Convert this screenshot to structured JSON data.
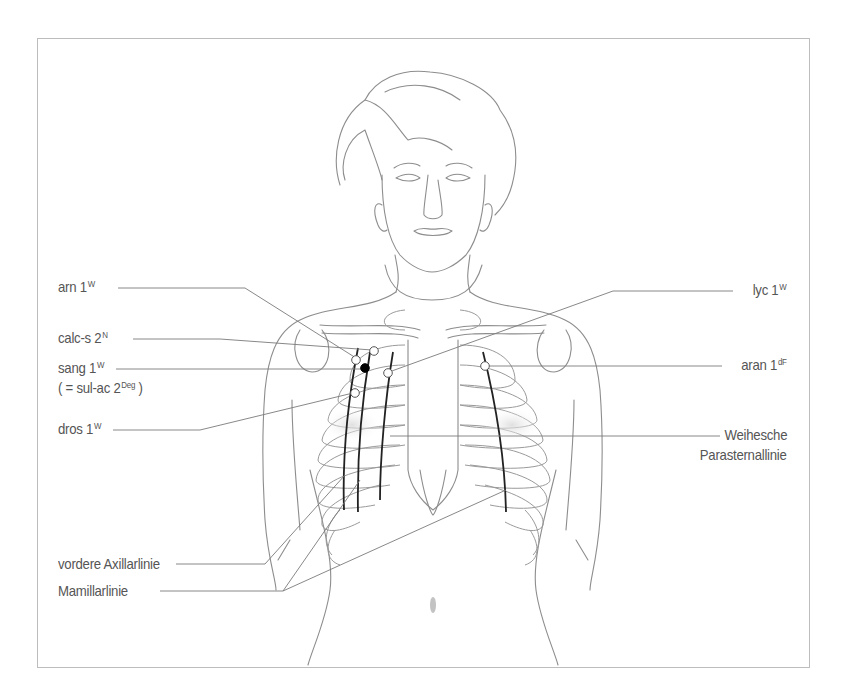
{
  "figure": {
    "colors": {
      "outline": "#8a8a8a",
      "leader": "#7a7a7a",
      "meridian": "#222222",
      "point_filled": "#000000",
      "point_open": "#ffffff",
      "frame": "#bdbdbd",
      "text": "#555555"
    }
  },
  "labels_left": [
    {
      "id": "arn",
      "text": "arn 1",
      "sup": "W"
    },
    {
      "id": "calc-s",
      "text": "calc-s 2",
      "sup": "N"
    },
    {
      "id": "sang",
      "text": "sang 1",
      "sup": "W"
    },
    {
      "id": "sul-ac",
      "text": "( = sul-ac 2",
      "sup": "Deg",
      "suffix": " )"
    },
    {
      "id": "dros",
      "text": "dros 1",
      "sup": "W"
    },
    {
      "id": "axillar",
      "text": "vordere Axillarlinie"
    },
    {
      "id": "mamillar",
      "text": "Mamillarlinie"
    }
  ],
  "labels_right": [
    {
      "id": "lyc",
      "text": "lyc 1",
      "sup": "W"
    },
    {
      "id": "aran",
      "text": "aran 1",
      "sup": "dF"
    },
    {
      "id": "weihe-1",
      "text": "Weihesche"
    },
    {
      "id": "weihe-2",
      "text": "Parasternallinie"
    }
  ],
  "points": [
    {
      "label": "arn 1W",
      "x": 356,
      "y": 360,
      "style": "open"
    },
    {
      "label": "calc-s 2N",
      "x": 374,
      "y": 351,
      "style": "open"
    },
    {
      "label": "sang 1W",
      "x": 365,
      "y": 368,
      "style": "filled"
    },
    {
      "label": "lyc 1W",
      "x": 388,
      "y": 373,
      "style": "open"
    },
    {
      "label": "dros 1W",
      "x": 355,
      "y": 393,
      "style": "open"
    },
    {
      "label": "aran 1dF",
      "x": 485,
      "y": 366,
      "style": "open"
    }
  ]
}
